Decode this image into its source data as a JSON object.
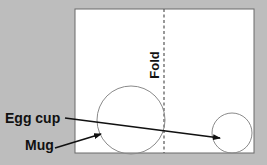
{
  "diagram": {
    "background_color": "#bdbdbd",
    "paper_color": "#ffffff",
    "line_color": "#111111",
    "circle_color": "#8a8a8a",
    "paper": {
      "x": 75,
      "y": 9,
      "width": 179,
      "height": 144
    },
    "fold": {
      "x": 164,
      "y1": 9,
      "y2": 153,
      "label": "Fold"
    },
    "circles": [
      {
        "name": "mug",
        "cx": 131,
        "cy": 120,
        "r": 34
      },
      {
        "name": "egg-cup",
        "cx": 232,
        "cy": 133,
        "r": 20
      }
    ],
    "labels": {
      "egg_cup": "Egg cup",
      "mug": "Mug"
    },
    "arrows": [
      {
        "name": "egg-cup-arrow",
        "x1": 65,
        "y1": 118,
        "x2": 220,
        "y2": 138
      },
      {
        "name": "mug-arrow",
        "x1": 55,
        "y1": 148,
        "x2": 101,
        "y2": 134
      }
    ]
  }
}
